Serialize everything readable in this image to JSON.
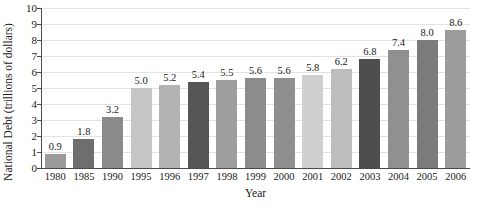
{
  "chart_data": {
    "type": "bar",
    "title": "",
    "xlabel": "Year",
    "ylabel": "National Debt (trillions of dollars)",
    "categories": [
      "1980",
      "1985",
      "1990",
      "1995",
      "1996",
      "1997",
      "1998",
      "1999",
      "2000",
      "2001",
      "2002",
      "2003",
      "2004",
      "2005",
      "2006"
    ],
    "values": [
      0.9,
      1.8,
      3.2,
      5.0,
      5.2,
      5.4,
      5.5,
      5.6,
      5.6,
      5.8,
      6.2,
      6.8,
      7.4,
      8.0,
      8.6
    ],
    "value_labels": [
      "0.9",
      "1.8",
      "3.2",
      "5.0",
      "5.2",
      "5.4",
      "5.5",
      "5.6",
      "5.6",
      "5.8",
      "6.2",
      "6.8",
      "7.4",
      "8.0",
      "8.6"
    ],
    "bar_colors": [
      "#9a9a9a",
      "#6e6e6e",
      "#8a8a8a",
      "#c6c6c6",
      "#b3b3b3",
      "#555555",
      "#9e9e9e",
      "#8c8c8c",
      "#8f8f8f",
      "#cfcfcf",
      "#bdbdbd",
      "#4e4e4e",
      "#909090",
      "#7b7b7b",
      "#9c9c9c"
    ],
    "ylim": [
      0,
      10
    ],
    "ytick_labels": [
      "0",
      "1",
      "2",
      "3",
      "4",
      "5",
      "6",
      "7",
      "8",
      "9",
      "10"
    ],
    "ytick_values": [
      0,
      1,
      2,
      3,
      4,
      5,
      6,
      7,
      8,
      9,
      10
    ],
    "grid": true,
    "grid_color": "#e2e2e2",
    "axis_color": "#4a4a4a",
    "text_color": "#1a1a1a",
    "legend": null
  }
}
